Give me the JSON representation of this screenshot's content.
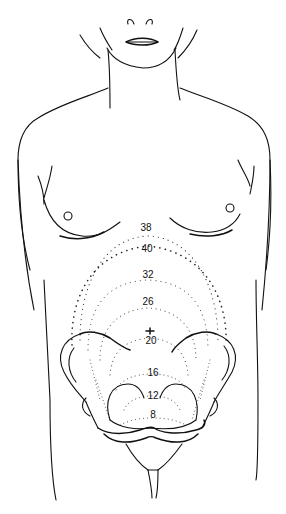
{
  "figure": {
    "week_labels": [
      {
        "week": "38",
        "x": 146,
        "y": 228
      },
      {
        "week": "40",
        "x": 147,
        "y": 249
      },
      {
        "week": "32",
        "x": 148,
        "y": 275
      },
      {
        "week": "26",
        "x": 148,
        "y": 302
      },
      {
        "week": "20",
        "x": 151,
        "y": 341
      },
      {
        "week": "16",
        "x": 153,
        "y": 373
      },
      {
        "week": "12",
        "x": 153,
        "y": 396
      },
      {
        "week": "8",
        "x": 153,
        "y": 415
      }
    ],
    "umbilicus_marker": {
      "x": 150,
      "y": 331
    },
    "colors": {
      "line": "#111111",
      "background": "#ffffff"
    }
  }
}
